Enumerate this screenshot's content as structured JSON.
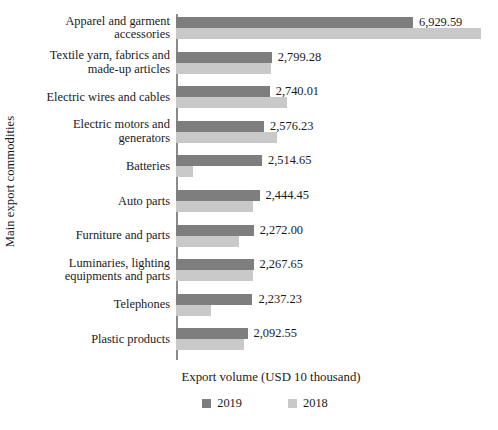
{
  "chart_data": {
    "type": "bar",
    "orientation": "horizontal",
    "title": "",
    "xlabel": "Export volume (USD 10 thousand)",
    "ylabel": "Main export commodities",
    "xlim": [
      0,
      7400
    ],
    "grid": false,
    "legend_position": "bottom",
    "categories": [
      "Apparel and garment accessories",
      "Textile yarn, fabrics and made-up articles",
      "Electric wires and cables",
      "Electric motors and generators",
      "Batteries",
      "Auto parts",
      "Furniture and parts",
      "Luminaries, lighting equipments and parts",
      "Telephones",
      "Plastic products"
    ],
    "series": [
      {
        "name": "2019",
        "color": "#7e7e7e",
        "values": [
          6929.59,
          2799.28,
          2740.01,
          2576.23,
          2514.65,
          2444.45,
          2272.0,
          2267.65,
          2237.23,
          2092.55
        ],
        "labels": [
          "6,929.59",
          "2,799.28",
          "2,740.01",
          "2,576.23",
          "2,514.65",
          "2,444.45",
          "2,272.00",
          "2,267.65",
          "2,237.23",
          "2,092.55"
        ]
      },
      {
        "name": "2018",
        "color": "#c9c9c9",
        "values": [
          8920.0,
          2770.0,
          3246.0,
          2954.0,
          497.0,
          2252.0,
          1842.0,
          2252.0,
          1023.0,
          1988.0
        ],
        "labels": [
          "",
          "",
          "",
          "",
          "",
          "",
          "",
          "",
          "",
          ""
        ]
      }
    ]
  },
  "legend": {
    "items": [
      {
        "label": "2019",
        "color": "#7e7e7e"
      },
      {
        "label": "2018",
        "color": "#c9c9c9"
      }
    ]
  }
}
